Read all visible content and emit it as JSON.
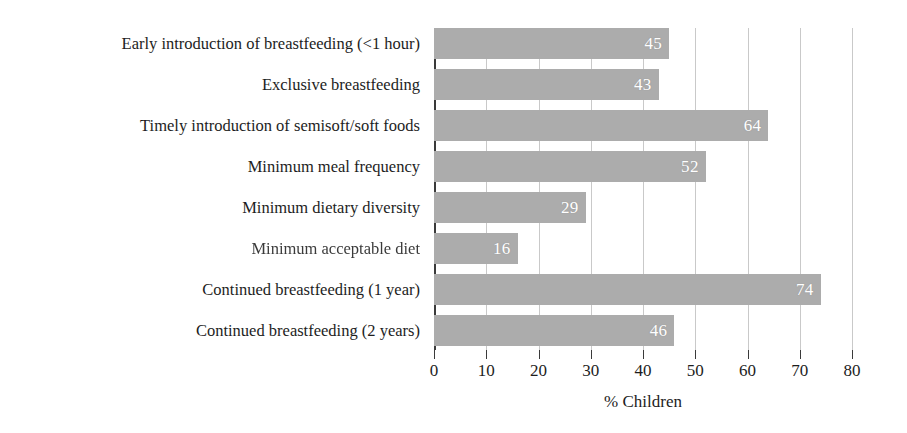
{
  "chart_data": {
    "type": "bar",
    "orientation": "horizontal",
    "title": "",
    "subtitle": "",
    "xlabel": "% Children",
    "ylabel": "",
    "xlim": [
      0,
      80
    ],
    "xticks": [
      0,
      10,
      20,
      30,
      40,
      50,
      60,
      70,
      80
    ],
    "xtick_labels": [
      "0",
      "10",
      "20",
      "30",
      "40",
      "50",
      "60",
      "70",
      "80"
    ],
    "grid": "vertical",
    "legend": "none",
    "bar_color": "#acacac",
    "value_label_color": "#ffffff",
    "axis_color": "#3a3a3a",
    "gridline_color": "#c9c9c9",
    "categories": [
      "Early introduction of breastfeeding (<1 hour)",
      "Exclusive breastfeeding",
      "Timely introduction of semisoft/soft foods",
      "Minimum meal frequency",
      "Minimum dietary diversity",
      "Minimum acceptable diet",
      "Continued breastfeeding (1 year)",
      "Continued breastfeeding (2 years)"
    ],
    "values": [
      45,
      43,
      64,
      52,
      29,
      16,
      74,
      46
    ],
    "value_labels": [
      "45",
      "43",
      "64",
      "52",
      "29",
      "16",
      "74",
      "46"
    ]
  }
}
